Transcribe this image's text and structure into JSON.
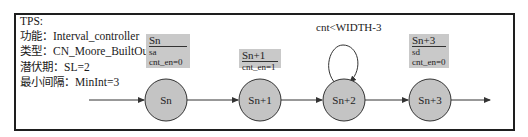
{
  "info": {
    "title": "TPS:",
    "function_line": "功能：Interval_controller",
    "type_line": "类型：CN_Moore_BuiltOut",
    "latency_line": "潜伏期：SL=2",
    "min_interval_line": "最小间隔：MinInt=3"
  },
  "states": [
    {
      "label": "Sn",
      "output_box": {
        "name": "Sn",
        "lines": [
          "sa",
          "cnt_en=0"
        ]
      }
    },
    {
      "label": "Sn+1",
      "output_box": {
        "name": "Sn+1",
        "lines": [
          "cnt_en=1"
        ]
      }
    },
    {
      "label": "Sn+2",
      "self_loop_label": "cnt<WIDTH-3"
    },
    {
      "label": "Sn+3",
      "output_box": {
        "name": "Sn+3",
        "lines": [
          "sd",
          "cnt_en=0"
        ]
      }
    }
  ],
  "colors": {
    "state_fill": "#c4c4c4",
    "output_box_fill": "#c9c9c9",
    "stroke": "#333333"
  }
}
